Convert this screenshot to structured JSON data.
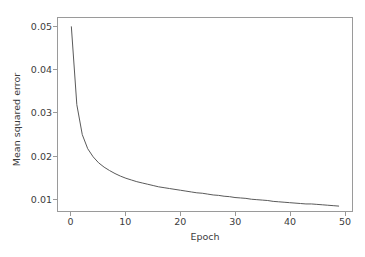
{
  "top_clipped_text": "·  ·        ·                         ·        ·              ·",
  "figure": {
    "background_color": "#ffffff",
    "axis_color": "#9a9a9a",
    "text_color": "#3c3c3c",
    "line_color": "#5a5a5a"
  },
  "chart_data": {
    "type": "line",
    "title": "",
    "xlabel": "Epoch",
    "ylabel": "Mean squared error",
    "xlim": [
      -2.45,
      51.45
    ],
    "ylim": [
      0.00695,
      0.05205
    ],
    "grid": false,
    "legend": null,
    "xticks": [
      0,
      10,
      20,
      30,
      40,
      50
    ],
    "xtick_labels": [
      "0",
      "10",
      "20",
      "30",
      "40",
      "50"
    ],
    "yticks": [
      0.01,
      0.02,
      0.03,
      0.04,
      0.05
    ],
    "ytick_labels": [
      "0.01",
      "0.02",
      "0.03",
      "0.04",
      "0.05"
    ],
    "series": [
      {
        "name": "Mean squared error",
        "color": "#5a5a5a",
        "linewidth": 1.0,
        "x": [
          0,
          1,
          2,
          3,
          4,
          5,
          6,
          7,
          8,
          9,
          10,
          11,
          12,
          13,
          14,
          15,
          16,
          17,
          18,
          19,
          20,
          21,
          22,
          23,
          24,
          25,
          26,
          27,
          28,
          29,
          30,
          31,
          32,
          33,
          34,
          35,
          36,
          37,
          38,
          39,
          40,
          41,
          42,
          43,
          44,
          45,
          46,
          47,
          48,
          49
        ],
        "values": [
          0.05,
          0.0318,
          0.0248,
          0.0215,
          0.0196,
          0.0182,
          0.0172,
          0.0164,
          0.0157,
          0.0151,
          0.0146,
          0.0142,
          0.0138,
          0.0135,
          0.0132,
          0.0129,
          0.0126,
          0.0124,
          0.0122,
          0.012,
          0.0118,
          0.0116,
          0.0114,
          0.0112,
          0.0111,
          0.0109,
          0.0107,
          0.0106,
          0.0104,
          0.0103,
          0.0101,
          0.01,
          0.0099,
          0.0097,
          0.0096,
          0.0095,
          0.0094,
          0.0092,
          0.0091,
          0.009,
          0.0089,
          0.0088,
          0.0087,
          0.0086,
          0.0086,
          0.0085,
          0.0084,
          0.0083,
          0.0082,
          0.0081
        ]
      }
    ]
  }
}
